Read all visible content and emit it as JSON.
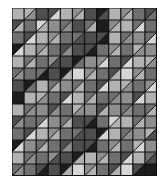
{
  "palette": {
    "W": "#d6d6d6",
    "L": "#b2b2b2",
    "M": "#8e8e8e",
    "G": "#707070",
    "D": "#4e4e4e",
    "K": "#1c1c1c"
  },
  "grid_lines_color": "#111111",
  "columns": 12,
  "rows": 14,
  "cells": [
    [
      "L",
      "L/M",
      "D",
      "D/W",
      "L",
      "M/L",
      "D",
      "K/D",
      "L",
      "M/L",
      "G",
      "D/G"
    ],
    [
      "D/L",
      "G",
      "W/L",
      "M",
      "G/M",
      "D",
      "G/L",
      "K",
      "M/L",
      "L",
      "G/W",
      "G"
    ],
    [
      "G",
      "D/W",
      "L",
      "M/L",
      "G",
      "G/D",
      "D",
      "D/K",
      "L",
      "G/M",
      "M",
      "G/W"
    ],
    [
      "K/W",
      "L",
      "M/L",
      "G",
      "D/M",
      "D",
      "D/K",
      "G",
      "M/L",
      "G",
      "L/M",
      "M"
    ],
    [
      "L",
      "G/L",
      "G",
      "M/D",
      "D",
      "K/G",
      "M",
      "M/W",
      "G",
      "D/W",
      "L",
      "L/M"
    ],
    [
      "G/M",
      "G",
      "G/K",
      "D",
      "K/L",
      "W",
      "M/L",
      "G",
      "D/L",
      "W",
      "M/L",
      "G"
    ],
    [
      "D",
      "K/G",
      "L",
      "G/L",
      "M",
      "G/L",
      "G",
      "D/W",
      "L",
      "L/M",
      "G",
      "M/W"
    ],
    [
      "K",
      "L",
      "L/M",
      "G",
      "D/W",
      "L",
      "G/L",
      "G",
      "G/M",
      "M",
      "D/W",
      "L"
    ],
    [
      "L",
      "G/M",
      "M",
      "D/M",
      "G",
      "L/M",
      "M",
      "D/L",
      "M",
      "G/M",
      "G",
      "G/L"
    ],
    [
      "D/M",
      "G",
      "G/W",
      "M",
      "G/L",
      "D",
      "D/K",
      "G",
      "W/L",
      "L",
      "G/L",
      "M"
    ],
    [
      "G",
      "D/W",
      "L",
      "M/L",
      "G",
      "G/D",
      "D",
      "K/W",
      "L",
      "G/M",
      "M",
      "L/D"
    ],
    [
      "K/W",
      "M",
      "G/L",
      "G",
      "D/M",
      "D",
      "D/K",
      "G",
      "M/L",
      "G",
      "L/W",
      "M"
    ],
    [
      "L",
      "G/M",
      "G",
      "M/D",
      "D",
      "K/L",
      "L",
      "M/L",
      "G",
      "D/W",
      "L",
      "G/D"
    ],
    [
      "G/M",
      "G",
      "D/K",
      "D",
      "K/L",
      "W",
      "M/L",
      "G",
      "D/L",
      "W",
      "D/K",
      "K"
    ]
  ]
}
